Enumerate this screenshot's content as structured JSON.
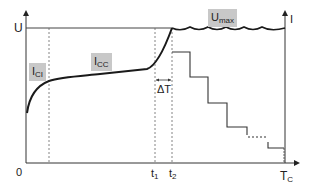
{
  "diagram": {
    "axes": {
      "left_axis_label": "U",
      "right_axis_label": "I",
      "origin_label": "0",
      "x_end_label_main": "T",
      "x_end_label_sub": "C"
    },
    "time_marks": [
      {
        "main": "t",
        "sub": "1"
      },
      {
        "main": "t",
        "sub": "2"
      }
    ],
    "regions": {
      "ici": {
        "main": "I",
        "sub": "CI"
      },
      "icc": {
        "main": "I",
        "sub": "CC"
      },
      "umax": {
        "main": "U",
        "sub": "max"
      },
      "delta_t": "ΔT"
    },
    "colors": {
      "line": "#1a1a1a",
      "axis": "#333333",
      "dashed": "#555555",
      "label_box": "#c8c8c8",
      "background": "#ffffff"
    }
  }
}
